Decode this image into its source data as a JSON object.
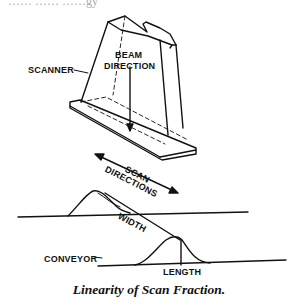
{
  "header": {
    "cut_off_text": "…… …… ……gy"
  },
  "labels": {
    "scanner": "SCANNER",
    "beam_line1": "BEAM",
    "beam_line2": "DIRECTION",
    "scan_line1": "SCAN",
    "scan_line2": "DIRECTIONS",
    "width": "WIDTH",
    "length": "LENGTH",
    "conveyor": "CONVEYOR"
  },
  "caption": "Linearity of Scan Fraction."
}
